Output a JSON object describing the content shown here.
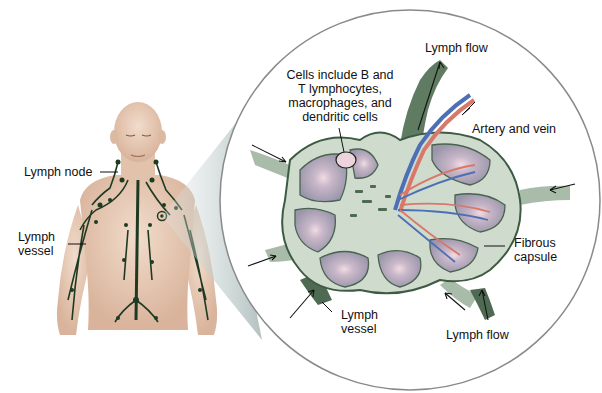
{
  "diagram": {
    "colors": {
      "skin": "#e9cdb8",
      "lymph_vessel": "#1f3a22",
      "node_capsule": "#cfdccd",
      "node_border": "#3d5a42",
      "lobule": "#a69fb4",
      "germinal_center": "#ecd3dc",
      "artery": "#d8786b",
      "vein": "#4d6fb5",
      "magnifier_cone": "#b9c7c6"
    },
    "labels": {
      "lymph_node": "Lymph node",
      "lymph_vessel_body": "Lymph\nvessel",
      "cells": "Cells include B and\nT lymphocytes,\nmacrophages, and\ndendritic cells",
      "lymph_flow_top": "Lymph flow",
      "artery_and_vein": "Artery and vein",
      "fibrous_capsule": "Fibrous\ncapsule",
      "lymph_vessel_node": "Lymph\nvessel",
      "lymph_flow_bottom": "Lymph flow"
    }
  }
}
